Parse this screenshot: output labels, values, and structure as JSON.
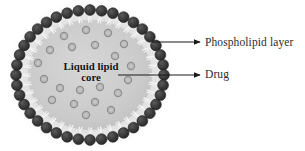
{
  "figure": {
    "type": "scientific-diagram",
    "background_color": "#ffffff"
  },
  "core": {
    "label_line1": "Liquid lipid",
    "label_line2": "core",
    "fill_color": "#cfcfcf",
    "text_color": "#111111"
  },
  "membrane": {
    "head_color": "#3a3a3a",
    "tail_color": "#f2f2f2",
    "head_count": 40,
    "halo_color": "#d8d8d8"
  },
  "drug": {
    "particle_color": "#b9b9b9",
    "particle_ring_color": "#8f8f8f",
    "count": 21,
    "positions": [
      {
        "x": 64,
        "y": 36
      },
      {
        "x": 86,
        "y": 30
      },
      {
        "x": 108,
        "y": 33
      },
      {
        "x": 124,
        "y": 44
      },
      {
        "x": 50,
        "y": 50
      },
      {
        "x": 72,
        "y": 47
      },
      {
        "x": 95,
        "y": 45
      },
      {
        "x": 115,
        "y": 56
      },
      {
        "x": 38,
        "y": 63
      },
      {
        "x": 131,
        "y": 66
      },
      {
        "x": 44,
        "y": 79
      },
      {
        "x": 128,
        "y": 80
      },
      {
        "x": 60,
        "y": 88
      },
      {
        "x": 80,
        "y": 90
      },
      {
        "x": 100,
        "y": 87
      },
      {
        "x": 118,
        "y": 93
      },
      {
        "x": 52,
        "y": 100
      },
      {
        "x": 74,
        "y": 104
      },
      {
        "x": 95,
        "y": 102
      },
      {
        "x": 111,
        "y": 110
      },
      {
        "x": 86,
        "y": 115
      }
    ]
  },
  "annotations": [
    {
      "id": "phospholipid",
      "text": "Phospholipid layer",
      "arrow": {
        "x1": 152,
        "y1": 42,
        "x2": 200,
        "y2": 42
      }
    },
    {
      "id": "drug",
      "text": "Drug",
      "arrow": {
        "x1": 118,
        "y1": 75,
        "x2": 200,
        "y2": 75
      }
    }
  ],
  "colors": {
    "line": "#1a1a1a",
    "text": "#2b2b2b"
  }
}
